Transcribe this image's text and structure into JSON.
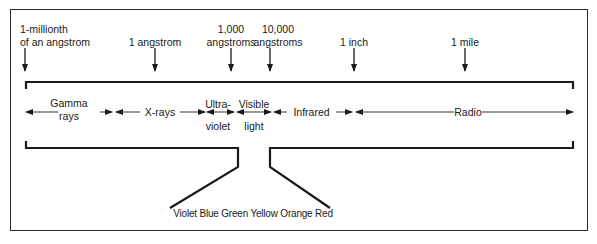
{
  "diagram": {
    "scale_markers": [
      {
        "id": "millionth-angstrom",
        "line1": "1-millionth",
        "line2": "of an angstrom",
        "x": 25
      },
      {
        "id": "angstrom",
        "line1": "",
        "line2": "1 angstrom",
        "x": 155
      },
      {
        "id": "1000-angstroms",
        "line1": "1,000",
        "line2": "angstroms",
        "x": 231
      },
      {
        "id": "10000-angstroms",
        "line1": "10,000",
        "line2": "angstroms",
        "x": 270
      },
      {
        "id": "inch",
        "line1": "",
        "line2": "1 inch",
        "x": 354
      },
      {
        "id": "mile",
        "line1": "",
        "line2": "1 mile",
        "x": 465
      }
    ],
    "bands": [
      {
        "id": "gamma",
        "line1": "Gamma",
        "line2": "rays",
        "start_x": 25,
        "end_x": 112
      },
      {
        "id": "xrays",
        "line1": "X-rays",
        "line2": "",
        "start_x": 114,
        "end_x": 205
      },
      {
        "id": "ultraviolet",
        "line1": "Ultra-",
        "line2": "violet",
        "start_x": 207,
        "end_x": 234
      },
      {
        "id": "visible",
        "line1": "Visible",
        "line2": "light",
        "start_x": 236,
        "end_x": 272
      },
      {
        "id": "infrared",
        "line1": "Infrared",
        "line2": "",
        "start_x": 274,
        "end_x": 355
      },
      {
        "id": "radio",
        "line1": "Radio",
        "line2": "",
        "start_x": 357,
        "end_x": 573
      }
    ],
    "visible_colors_label": "Violet Blue Green Yellow Orange Red",
    "visible_colors": [
      "Violet",
      "Blue",
      "Green",
      "Yellow",
      "Orange",
      "Red"
    ],
    "line_color": "#1a1a1a"
  }
}
